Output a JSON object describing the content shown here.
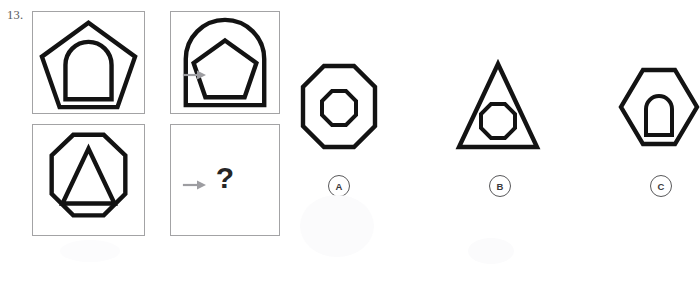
{
  "question": {
    "number": "13.",
    "unknown_marker": "?"
  },
  "matrix": {
    "cells": [
      {
        "position": "top-left",
        "outer_shape": "pentagon",
        "inner_shape": "arch",
        "name": "pentagon-with-arch"
      },
      {
        "position": "top-right",
        "outer_shape": "arch",
        "inner_shape": "pentagon",
        "name": "arch-with-pentagon"
      },
      {
        "position": "bottom-left",
        "outer_shape": "octagon",
        "inner_shape": "triangle",
        "name": "octagon-with-triangle"
      },
      {
        "position": "bottom-right",
        "outer_shape": "unknown",
        "inner_shape": "unknown",
        "name": "unknown-cell"
      }
    ],
    "relation_icon": "right-arrow"
  },
  "options": [
    {
      "label": "A",
      "outer_shape": "octagon",
      "inner_shape": "octagon",
      "name": "octagon-with-octagon"
    },
    {
      "label": "B",
      "outer_shape": "triangle",
      "inner_shape": "octagon",
      "name": "triangle-with-octagon"
    },
    {
      "label": "C",
      "outer_shape": "hexagon",
      "inner_shape": "arch",
      "name": "hexagon-with-arch"
    }
  ],
  "colors": {
    "ink": "#131313",
    "panel_border": "#a3a3a5",
    "arrow": "#9d9da1",
    "label_text": "#3a3a3c",
    "background": "#ffffff"
  }
}
